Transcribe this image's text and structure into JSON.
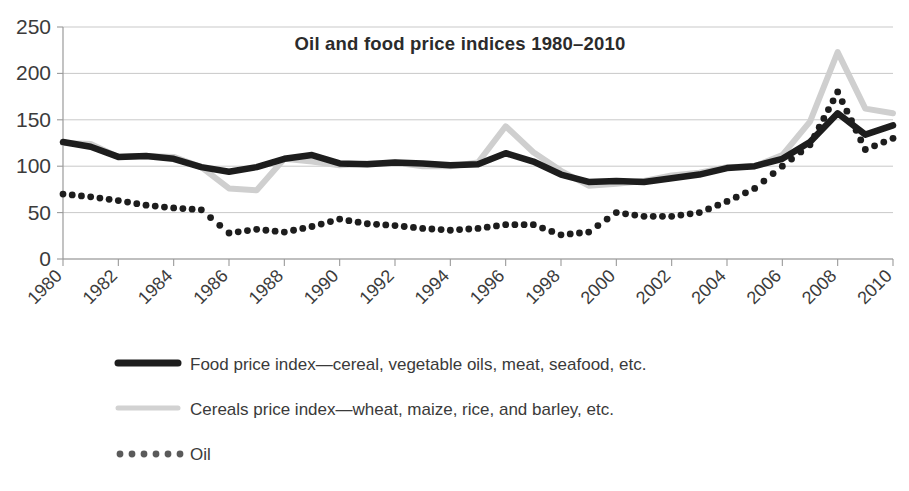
{
  "chart_data": {
    "type": "line",
    "title": "Oil and food price indices 1980–2010",
    "xlabel": "",
    "ylabel": "",
    "ylim": [
      0,
      250
    ],
    "yticks": [
      0,
      50,
      100,
      150,
      200,
      250
    ],
    "xlim": [
      1980,
      2010
    ],
    "grid": true,
    "legend_position": "below",
    "x": [
      1980,
      1981,
      1982,
      1983,
      1984,
      1985,
      1986,
      1987,
      1988,
      1989,
      1990,
      1991,
      1992,
      1993,
      1994,
      1995,
      1996,
      1997,
      1998,
      1999,
      2000,
      2001,
      2002,
      2003,
      2004,
      2005,
      2006,
      2007,
      2008,
      2009,
      2010
    ],
    "xticks": [
      1980,
      1982,
      1984,
      1986,
      1988,
      1990,
      1992,
      1994,
      1996,
      1998,
      2000,
      2002,
      2004,
      2006,
      2008,
      2010
    ],
    "xtick_labels": [
      "1980",
      "1982",
      "1984",
      "1986",
      "1988",
      "1990",
      "1992",
      "1994",
      "1996",
      "1998",
      "2000",
      "2002",
      "2004",
      "2006",
      "2008",
      "2010"
    ],
    "ytick_labels": [
      "0",
      "50",
      "100",
      "150",
      "200",
      "250"
    ],
    "series": [
      {
        "name": "Food price index—cereal, vegetable oils, meat, seafood, etc.",
        "style": "solid-thick",
        "color": "#1d1d1d",
        "values": [
          126,
          121,
          110,
          111,
          108,
          99,
          94,
          99,
          108,
          112,
          103,
          102,
          104,
          103,
          101,
          102,
          114,
          105,
          91,
          83,
          84,
          83,
          87,
          91,
          98,
          100,
          108,
          126,
          157,
          134,
          144
        ]
      },
      {
        "name": "Cereals price index—wheat, maize,  rice, and barley, etc.",
        "style": "solid-light",
        "color": "#cfcfcf",
        "values": [
          125,
          124,
          110,
          111,
          110,
          99,
          76,
          74,
          108,
          105,
          101,
          103,
          104,
          100,
          100,
          104,
          143,
          115,
          95,
          79,
          81,
          84,
          90,
          93,
          99,
          100,
          112,
          148,
          223,
          162,
          157
        ]
      },
      {
        "name": "Oil",
        "style": "dotted",
        "color": "#1d1d1d",
        "values": [
          70,
          67,
          63,
          58,
          55,
          53,
          28,
          32,
          29,
          35,
          43,
          38,
          36,
          33,
          31,
          33,
          37,
          37,
          26,
          29,
          50,
          46,
          46,
          50,
          62,
          76,
          100,
          123,
          180,
          118,
          130
        ]
      }
    ],
    "legend": [
      {
        "label": "Food price index—cereal, vegetable oils, meat, seafood, etc.",
        "marker": "solid-thick-line",
        "color": "#1d1d1d"
      },
      {
        "label": "Cereals price index—wheat, maize,  rice, and barley, etc.",
        "marker": "solid-light-line",
        "color": "#d2d2d2"
      },
      {
        "label": "Oil",
        "marker": "dotted-line",
        "color": "#5a5a5a"
      }
    ]
  }
}
